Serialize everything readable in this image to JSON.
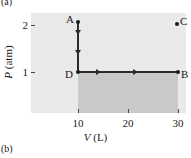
{
  "figure": {
    "panel_a_label": "(a)",
    "panel_b_label": "(b)"
  },
  "axes": {
    "x_title_var": "V",
    "x_title_unit": "(L)",
    "y_title_var": "P",
    "y_title_unit": "(atm)",
    "x_ticks": [
      "10",
      "20",
      "30"
    ],
    "y_ticks": [
      "1",
      "2"
    ]
  },
  "points": {
    "a": "A",
    "b": "B",
    "c": "C",
    "d": "D"
  },
  "colors": {
    "plot_background": "#e9e9e9",
    "work_region": "#c9c9c9",
    "line": "#2b2b2b",
    "text": "#1a1a1a"
  },
  "chart_data": {
    "type": "line",
    "title": "",
    "xlabel": "V (L)",
    "ylabel": "P (atm)",
    "xlim": [
      0,
      33
    ],
    "ylim": [
      0,
      2.4
    ],
    "x_ticks": [
      10,
      20,
      30
    ],
    "y_ticks": [
      1,
      2
    ],
    "grid": false,
    "legend": null,
    "points": [
      {
        "label": "A",
        "x": 10,
        "y": 2.0
      },
      {
        "label": "D",
        "x": 10,
        "y": 1.0
      },
      {
        "label": "B",
        "x": 30,
        "y": 1.0
      },
      {
        "label": "C",
        "x": 30,
        "y": 2.0
      }
    ],
    "series": [
      {
        "name": "A to D (isochoric decompression)",
        "x": [
          10,
          10
        ],
        "y": [
          2.0,
          1.0
        ],
        "arrow_direction": "down",
        "arrow_count": 2
      },
      {
        "name": "D to B (isobaric expansion)",
        "x": [
          10,
          30
        ],
        "y": [
          1.0,
          1.0
        ],
        "arrow_direction": "right",
        "arrow_count": 2
      }
    ],
    "shaded_regions": [
      {
        "name": "work-under-DB",
        "x_range": [
          10,
          30
        ],
        "y_range": [
          0,
          1.0
        ],
        "color": "#c9c9c9"
      }
    ],
    "isolated_points": [
      {
        "label": "C",
        "x": 30,
        "y": 2.0
      }
    ]
  }
}
